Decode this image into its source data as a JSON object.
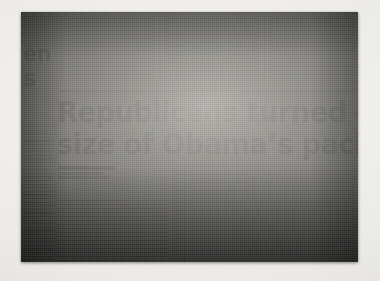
{
  "scene": {
    "description": "photograph-of-newspaper-page",
    "paper_background": "#eceae6",
    "newsprint_gray": "#8d8b86",
    "ink_color": "#16161a"
  },
  "newspaper": {
    "headline": {
      "line1": "Republicans turned off by",
      "line2": "size of Obama’s package"
    },
    "edge_fragments": {
      "upper": "en",
      "lower": "s"
    },
    "byline": {
      "name_legible": false,
      "lines_count": 3
    },
    "top_columns": [
      {
        "name": "top-column-1",
        "legible": false
      },
      {
        "name": "top-column-2",
        "legible": false
      },
      {
        "name": "top-column-3",
        "legible": false
      }
    ],
    "lower_columns": [
      {
        "name": "left-rail-column",
        "legible": false
      },
      {
        "name": "body-column-1",
        "legible": false
      },
      {
        "name": "body-column-2",
        "legible": false
      }
    ],
    "rules": {
      "horizontal_under_top_band": true,
      "vertical_column_dividers": true
    }
  }
}
